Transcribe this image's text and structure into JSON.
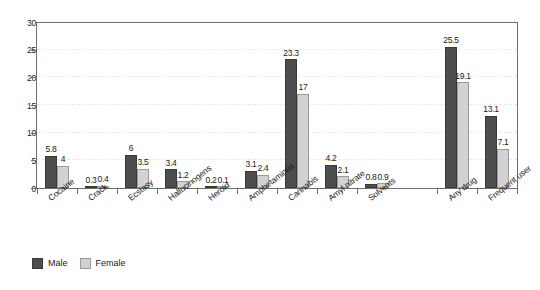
{
  "chart_data": {
    "type": "bar",
    "title": "",
    "subtitle": "",
    "xlabel": "",
    "ylabel": "",
    "ylim": [
      0,
      30
    ],
    "yticks": [
      0,
      5,
      10,
      15,
      20,
      25,
      30
    ],
    "ytick_labels": [
      "0",
      "5",
      "10",
      "15",
      "20",
      "25",
      "30"
    ],
    "grid": true,
    "grid_style": "dashed-horizontal",
    "legend_position": "bottom-left",
    "categories": [
      "Cocaine",
      "Crack",
      "Ecstasy",
      "Hallucinogens",
      "Heroin",
      "Amphetamines",
      "Cannabis",
      "Amyl nitrate",
      "Solvents",
      "Any drug",
      "Frequent user"
    ],
    "series": [
      {
        "name": "Male",
        "color": "#4d4d4d",
        "values": [
          5.8,
          0.3,
          6,
          3.4,
          0.2,
          3.1,
          23.3,
          4.2,
          0.8,
          25.5,
          13.1
        ],
        "value_labels": [
          "5.8",
          "0.3",
          "6",
          "3.4",
          "0.2",
          "3.1",
          "23.3",
          "4.2",
          "0.8",
          "25.5",
          "13.1"
        ]
      },
      {
        "name": "Female",
        "color": "#d2d2d2",
        "values": [
          4,
          0.4,
          3.5,
          1.2,
          0.1,
          2.4,
          17,
          2.1,
          0.9,
          19.1,
          7.1
        ],
        "value_labels": [
          "4",
          "0.4",
          "3.5",
          "1.2",
          "0.1",
          "2.4",
          "17",
          "2.1",
          "0.9",
          "19.1",
          "7.1"
        ]
      }
    ],
    "group_gap_after_index": 8
  },
  "legend": {
    "items": [
      {
        "label": "Male",
        "swatch": "male"
      },
      {
        "label": "Female",
        "swatch": "female"
      }
    ]
  }
}
